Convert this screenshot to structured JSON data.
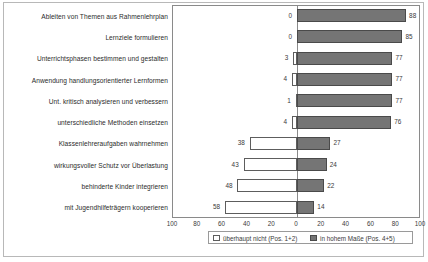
{
  "chart_data": {
    "type": "bar",
    "orientation": "horizontal",
    "subtype": "diverging-bar",
    "title": "",
    "subtitle": "",
    "xlabel": "",
    "ylabel": "",
    "xlim": [
      -100,
      100
    ],
    "grid": false,
    "legend_position": "bottom",
    "axis_ticks": [
      "100",
      "80",
      "60",
      "40",
      "20",
      "0",
      "20",
      "40",
      "60",
      "80",
      "100"
    ],
    "axis_tick_values": [
      -100,
      -80,
      -60,
      -40,
      -20,
      0,
      20,
      40,
      60,
      80,
      100
    ],
    "categories": [
      "Ableiten von Themen aus Rahmenlehrplan",
      "Lernziele formulieren",
      "Unterrichtsphasen bestimmen und gestalten",
      "Anwendung handlungsorientierter Lernformen",
      "Unt. kritisch analysieren und verbessern",
      "unterschiedliche Methoden einsetzen",
      "Klassenlehreraufgaben wahrnehmen",
      "wirkungsvoller Schutz vor Überlastung",
      "behinderte Kinder integrieren",
      "mit Jugendhilfeträgern kooperieren"
    ],
    "series": [
      {
        "name": "überhaupt nicht (Pos. 1+2)",
        "side": "left",
        "color": "#ffffff",
        "border_color": "#5d5d5d",
        "values": [
          0,
          0,
          3,
          4,
          1,
          4,
          38,
          43,
          48,
          58
        ]
      },
      {
        "name": "in hohem Maße (Pos. 4+5)",
        "side": "right",
        "color": "#757575",
        "border_color": "#4a4a4a",
        "values": [
          88,
          85,
          77,
          77,
          77,
          76,
          27,
          24,
          22,
          14
        ]
      }
    ],
    "legend": [
      {
        "label": "überhaupt nicht (Pos. 1+2)",
        "swatch": "neg"
      },
      {
        "label": "in hohem Maße (Pos. 4+5)",
        "swatch": "pos"
      }
    ]
  }
}
